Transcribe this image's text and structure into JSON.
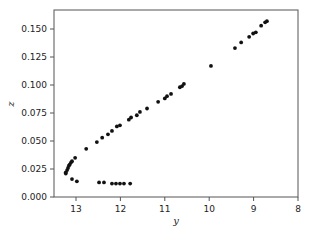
{
  "chart_data": {
    "type": "scatter",
    "title": "",
    "xlabel": "y",
    "ylabel": "z",
    "xlim": [
      13.5,
      8
    ],
    "x_reversed": true,
    "ylim": [
      0.0,
      0.165
    ],
    "grid": false,
    "legend": null,
    "xticks": [
      13,
      12,
      11,
      10,
      9,
      8
    ],
    "yticks": [
      "0.000",
      "0.025",
      "0.050",
      "0.075",
      "0.100",
      "0.125",
      "0.150"
    ],
    "marker_color": "#111111",
    "series": [
      {
        "name": "points",
        "points": [
          [
            13.23,
            0.022
          ],
          [
            13.23,
            0.021
          ],
          [
            13.2,
            0.024
          ],
          [
            13.18,
            0.026
          ],
          [
            13.16,
            0.028
          ],
          [
            13.14,
            0.029
          ],
          [
            13.11,
            0.031
          ],
          [
            13.09,
            0.032
          ],
          [
            13.02,
            0.035
          ],
          [
            13.09,
            0.016
          ],
          [
            12.98,
            0.014
          ],
          [
            12.48,
            0.013
          ],
          [
            12.37,
            0.013
          ],
          [
            12.19,
            0.012
          ],
          [
            12.1,
            0.012
          ],
          [
            12.01,
            0.012
          ],
          [
            11.92,
            0.012
          ],
          [
            11.78,
            0.012
          ],
          [
            12.77,
            0.043
          ],
          [
            12.53,
            0.049
          ],
          [
            12.41,
            0.053
          ],
          [
            12.28,
            0.056
          ],
          [
            12.19,
            0.059
          ],
          [
            12.08,
            0.063
          ],
          [
            12.01,
            0.064
          ],
          [
            11.81,
            0.069
          ],
          [
            11.76,
            0.071
          ],
          [
            11.63,
            0.073
          ],
          [
            11.56,
            0.076
          ],
          [
            11.4,
            0.079
          ],
          [
            11.15,
            0.085
          ],
          [
            11.0,
            0.088
          ],
          [
            10.95,
            0.09
          ],
          [
            10.86,
            0.092
          ],
          [
            10.66,
            0.098
          ],
          [
            10.61,
            0.099
          ],
          [
            10.57,
            0.101
          ],
          [
            9.96,
            0.117
          ],
          [
            9.42,
            0.133
          ],
          [
            9.28,
            0.138
          ],
          [
            9.1,
            0.143
          ],
          [
            9.01,
            0.146
          ],
          [
            8.95,
            0.147
          ],
          [
            8.83,
            0.153
          ],
          [
            8.74,
            0.156
          ],
          [
            8.7,
            0.157
          ]
        ]
      }
    ]
  }
}
